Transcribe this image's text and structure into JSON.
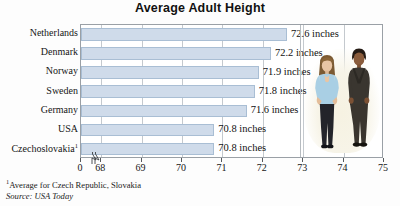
{
  "chart_data": {
    "type": "bar",
    "orientation": "horizontal",
    "title": "Average Adult Height",
    "xlabel": "",
    "ylabel": "",
    "categories": [
      "Netherlands",
      "Denmark",
      "Norway",
      "Sweden",
      "Germany",
      "USA",
      "Czechoslovakia¹"
    ],
    "values": [
      72.6,
      72.2,
      71.9,
      71.8,
      71.6,
      70.8,
      70.8
    ],
    "value_labels": [
      "72.6 inches",
      "72.2 inches",
      "71.9 inches",
      "71.8 inches",
      "71.6 inches",
      "70.8 inches",
      "70.8 inches"
    ],
    "unit": "inches",
    "xlim": [
      67.5,
      75
    ],
    "x_tick_labels": [
      "0",
      "68",
      "69",
      "70",
      "71",
      "72",
      "73",
      "74",
      "75"
    ],
    "x_tick_values": [
      null,
      68,
      69,
      70,
      71,
      72,
      73,
      74,
      75
    ],
    "axis_break": true,
    "grid": true,
    "grid_axis": "x",
    "legend": null,
    "bar_color": "#cfdbea",
    "bar_border_color": "#a9bed4",
    "frame_color": "#9aa0a6",
    "gridline_color": "#c4c9ce"
  },
  "footnotes": {
    "marker": "1",
    "note": "Average for Czech Republic, Slovakia",
    "source": "Source: USA Today"
  },
  "photo": {
    "caption": "photograph of a standing couple",
    "alt_left": "woman in light blue top and dark trousers",
    "alt_right": "man in dark suit with tie"
  }
}
